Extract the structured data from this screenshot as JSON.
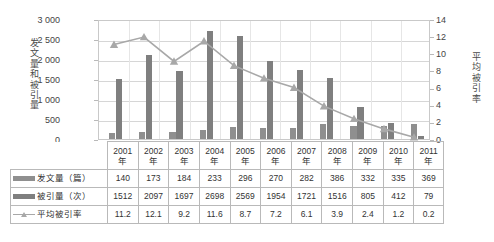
{
  "chart_data": {
    "type": "bar",
    "title": "",
    "xlabel": "",
    "ylabel": "发文量和被引量",
    "y2label": "平均被引率",
    "categories": [
      "2001年",
      "2002年",
      "2003年",
      "2004年",
      "2005年",
      "2006年",
      "2007年",
      "2008年",
      "2009年",
      "2010年",
      "2011年"
    ],
    "category_lines": [
      [
        "2001",
        "年"
      ],
      [
        "2002",
        "年"
      ],
      [
        "2003",
        "年"
      ],
      [
        "2004",
        "年"
      ],
      [
        "2005",
        "年"
      ],
      [
        "2006",
        "年"
      ],
      [
        "2007",
        "年"
      ],
      [
        "2008",
        "年"
      ],
      [
        "2009",
        "年"
      ],
      [
        "2010",
        "年"
      ],
      [
        "2011",
        "年"
      ]
    ],
    "series": [
      {
        "name": "发文量（篇）",
        "type": "bar",
        "axis": "left",
        "values": [
          140,
          173,
          184,
          233,
          296,
          270,
          282,
          386,
          332,
          335,
          369
        ]
      },
      {
        "name": "被引量（次）",
        "type": "bar",
        "axis": "left",
        "values": [
          1512,
          2097,
          1697,
          2698,
          2569,
          1954,
          1721,
          1516,
          805,
          412,
          79
        ]
      },
      {
        "name": "平均被引率",
        "type": "line",
        "axis": "right",
        "values": [
          11.2,
          12.1,
          9.2,
          11.6,
          8.7,
          7.2,
          6.1,
          3.9,
          2.4,
          1.2,
          0.2
        ]
      }
    ],
    "ylim": [
      0,
      3000
    ],
    "yticks": [
      "0",
      "500",
      "1 000",
      "1 500",
      "2 000",
      "2 500",
      "3 000"
    ],
    "ytick_values": [
      0,
      500,
      1000,
      1500,
      2000,
      2500,
      3000
    ],
    "y2lim": [
      0,
      14
    ],
    "y2ticks": [
      "0",
      "2",
      "4",
      "6",
      "8",
      "10",
      "12",
      "14"
    ],
    "y2tick_values": [
      0,
      2,
      4,
      6,
      8,
      10,
      12,
      14
    ],
    "grid": true,
    "legend_position": "data-table",
    "colors": {
      "bar_small": "#8f8f8f",
      "bar_big": "#7f7f7f",
      "line": "#a8a8a8",
      "grid": "#d6d6d6",
      "axis": "#c9c9c9",
      "text": "#3a3a3a"
    }
  },
  "table": {
    "row_labels": [
      "发文量（篇）",
      "被引量（次）",
      "平均被引率"
    ],
    "rows": [
      [
        "140",
        "173",
        "184",
        "233",
        "296",
        "270",
        "282",
        "386",
        "332",
        "335",
        "369"
      ],
      [
        "1512",
        "2097",
        "1697",
        "2698",
        "2569",
        "1954",
        "1721",
        "1516",
        "805",
        "412",
        "79"
      ],
      [
        "11.2",
        "12.1",
        "9.2",
        "11.6",
        "8.7",
        "7.2",
        "6.1",
        "3.9",
        "2.4",
        "1.2",
        "0.2"
      ]
    ]
  },
  "axis_titles": {
    "left_chars": [
      "发",
      "文",
      "量",
      "和",
      "被",
      "引",
      "量"
    ],
    "right_chars": [
      "平",
      "均",
      "被",
      "引",
      "率"
    ]
  }
}
